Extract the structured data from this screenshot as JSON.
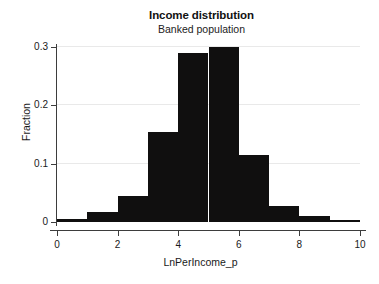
{
  "chart_data": {
    "type": "bar",
    "title": "Income distribution",
    "subtitle": "Banked population",
    "xlabel": "LnPerIncome_p",
    "ylabel": "Fraction",
    "xlim": [
      0,
      10
    ],
    "ylim": [
      0,
      0.3
    ],
    "grid": true,
    "legend": null,
    "bin_width": 1,
    "bar_color": "#100f0f",
    "grid_color": "#e9e9e9",
    "axis_color": "#3d3d3d",
    "background_color": "#ffffff",
    "categories": [
      "0-1",
      "1-2",
      "2-3",
      "3-4",
      "4-5",
      "5-6",
      "6-7",
      "7-8",
      "8-9",
      "9-10"
    ],
    "bin_starts": [
      0,
      1,
      2,
      3,
      4,
      5,
      6,
      7,
      8,
      9
    ],
    "bin_ends": [
      1,
      2,
      3,
      4,
      5,
      6,
      7,
      8,
      9,
      10
    ],
    "values": [
      0.005,
      0.017,
      0.045,
      0.155,
      0.29,
      0.3,
      0.115,
      0.028,
      0.01,
      0.003
    ],
    "x_ticks": [
      0,
      2,
      4,
      6,
      8,
      10
    ],
    "x_tick_labels": [
      "0",
      "2",
      "4",
      "6",
      "8",
      "10"
    ],
    "y_ticks": [
      0,
      0.1,
      0.2,
      0.3
    ],
    "y_tick_labels": [
      "0",
      "0.1",
      "0.2",
      "0.3"
    ]
  }
}
